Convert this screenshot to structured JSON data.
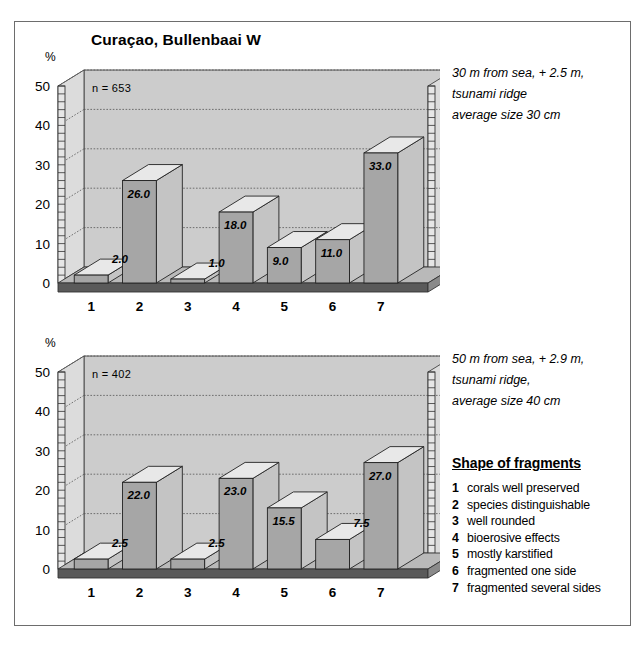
{
  "figure": {
    "title": "Curaçao, Bullenbaai W",
    "legend": {
      "title": "Shape of fragments",
      "items": [
        {
          "num": "1",
          "label": "corals well preserved"
        },
        {
          "num": "2",
          "label": "species distinguishable"
        },
        {
          "num": "3",
          "label": "well rounded"
        },
        {
          "num": "4",
          "label": "bioerosive effects"
        },
        {
          "num": "5",
          "label": "mostly karstified"
        },
        {
          "num": "6",
          "label": "fragmented one side"
        },
        {
          "num": "7",
          "label": "fragmented several sides"
        }
      ]
    }
  },
  "chart_data": [
    {
      "type": "bar",
      "title": "Curaçao, Bullenbaai W",
      "xlabel": "",
      "ylabel": "%",
      "ylim": [
        0,
        50
      ],
      "yticks": [
        0,
        10,
        20,
        30,
        40,
        50
      ],
      "ytick_labels": [
        "0",
        "10",
        "20",
        "30",
        "40",
        "50"
      ],
      "categories": [
        "1",
        "2",
        "3",
        "4",
        "5",
        "6",
        "7"
      ],
      "values": [
        2.0,
        26.0,
        1.0,
        18.0,
        9.0,
        11.0,
        33.0
      ],
      "value_labels": [
        "2.0",
        "26.0",
        "1.0",
        "18.0",
        "9.0",
        "11.0",
        "33.0"
      ],
      "sample_size": "n = 653",
      "annotation": [
        "30 m from sea, + 2.5 m,",
        "tsunami ridge",
        "average size 30 cm"
      ],
      "grid": true,
      "legend_position": "right"
    },
    {
      "type": "bar",
      "title": "",
      "xlabel": "",
      "ylabel": "%",
      "ylim": [
        0,
        50
      ],
      "yticks": [
        0,
        10,
        20,
        30,
        40,
        50
      ],
      "ytick_labels": [
        "0",
        "10",
        "20",
        "30",
        "40",
        "50"
      ],
      "categories": [
        "1",
        "2",
        "3",
        "4",
        "5",
        "6",
        "7"
      ],
      "values": [
        2.5,
        22.0,
        2.5,
        23.0,
        15.5,
        7.5,
        27.0
      ],
      "value_labels": [
        "2.5",
        "22.0",
        "2.5",
        "23.0",
        "15.5",
        "7.5",
        "27.0"
      ],
      "sample_size": "n = 402",
      "annotation": [
        "50 m from sea, + 2.9 m,",
        "tsunami ridge,",
        "average size 40 cm"
      ],
      "grid": true,
      "legend_position": "right"
    }
  ],
  "colors": {
    "bar_front": "#a6a6a6",
    "bar_top": "#e8e8e8",
    "bar_side": "#c4c4c4",
    "plot_bg": "#cccccc",
    "wall_bg": "#dcdcdc",
    "floor": "#5a5a5a",
    "frame": "#6d6d6d",
    "grid": "#555555"
  }
}
